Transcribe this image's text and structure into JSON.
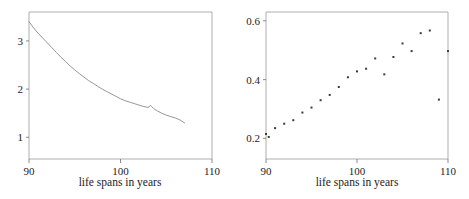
{
  "figure": {
    "width": 469,
    "height": 199,
    "background": "#ffffff",
    "axis_color": "#9a9a9a",
    "line_color": "#8a8a8a",
    "point_color": "#3a3a3a"
  },
  "panels": [
    {
      "id": "left",
      "xlabel": "life spans in years",
      "x_ticks": [
        "90",
        "100",
        "110"
      ],
      "y_ticks": [
        "1",
        "2",
        "3"
      ]
    },
    {
      "id": "right",
      "xlabel": "life spans in years",
      "x_ticks": [
        "90",
        "100",
        "110"
      ],
      "y_ticks": [
        "0.2",
        "0.4",
        "0.6"
      ]
    }
  ],
  "chart_data": [
    {
      "type": "line",
      "title": "",
      "xlabel": "life spans in years",
      "ylabel": "",
      "xlim": [
        90,
        110
      ],
      "ylim": [
        0.55,
        3.6
      ],
      "xticks": [
        90,
        100,
        110
      ],
      "yticks": [
        1,
        2,
        3
      ],
      "grid": false,
      "legend": "none",
      "x": [
        90.0,
        90.5,
        91.0,
        91.5,
        92.0,
        92.5,
        93.0,
        93.5,
        94.0,
        94.5,
        95.0,
        95.5,
        96.0,
        96.5,
        97.0,
        97.5,
        98.0,
        98.5,
        99.0,
        99.5,
        100.0,
        100.5,
        101.0,
        101.5,
        102.0,
        102.5,
        103.0,
        103.3,
        103.6,
        104.0,
        104.5,
        105.0,
        105.5,
        106.0,
        106.5,
        107.0
      ],
      "y": [
        3.4,
        3.27,
        3.16,
        3.06,
        2.96,
        2.86,
        2.76,
        2.66,
        2.57,
        2.48,
        2.4,
        2.32,
        2.25,
        2.18,
        2.12,
        2.06,
        2.0,
        1.95,
        1.9,
        1.85,
        1.8,
        1.76,
        1.73,
        1.7,
        1.67,
        1.64,
        1.62,
        1.66,
        1.6,
        1.55,
        1.5,
        1.46,
        1.43,
        1.4,
        1.36,
        1.3
      ]
    },
    {
      "type": "scatter",
      "title": "",
      "xlabel": "life spans in years",
      "ylabel": "",
      "xlim": [
        90,
        110
      ],
      "ylim": [
        0.13,
        0.63
      ],
      "xticks": [
        90,
        100,
        110
      ],
      "yticks": [
        0.2,
        0.4,
        0.6
      ],
      "grid": false,
      "legend": "none",
      "x": [
        90.0,
        90.3,
        91.0,
        92.0,
        93.0,
        94.0,
        95.0,
        96.0,
        97.0,
        98.0,
        99.0,
        100.0,
        101.0,
        102.0,
        103.0,
        104.0,
        105.0,
        106.0,
        107.0,
        108.0,
        109.0,
        110.0
      ],
      "y": [
        0.215,
        0.205,
        0.235,
        0.25,
        0.262,
        0.288,
        0.305,
        0.33,
        0.348,
        0.375,
        0.408,
        0.428,
        0.437,
        0.472,
        0.418,
        0.477,
        0.523,
        0.497,
        0.558,
        0.567,
        0.332,
        0.497
      ]
    }
  ]
}
